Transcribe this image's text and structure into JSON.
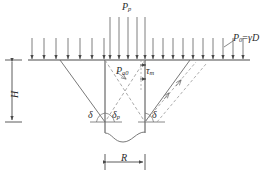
{
  "figure": {
    "domain": "engineering-diagram",
    "stroke_color": "#4a4a4a",
    "dash_color": "#8c8c8c",
    "text_color": "#2b2b2b",
    "background": "#ffffff"
  },
  "labels": {
    "top_load": {
      "base": "P",
      "sub": "p"
    },
    "surface_pressure": {
      "base": "P",
      "sub": "0",
      "equals": "=",
      "expr": "γD"
    },
    "interior_pressure": {
      "base": "P",
      "sub": "a0"
    },
    "shear_stress": {
      "base": "τ",
      "sub": "m"
    },
    "depth": {
      "base": "H"
    },
    "radius": {
      "base": "R"
    },
    "angle_left": {
      "base": "δ"
    },
    "angle_mid": {
      "base": "δ",
      "sub": "p"
    },
    "angle_right": {
      "base": "δ"
    }
  },
  "geometry": {
    "ground_line_y": 60,
    "shaft_left_x": 105,
    "shaft_right_x": 145,
    "shaft_base_y": 122,
    "wedge_left_apex_x": 60,
    "wedge_right_apex_x": 190,
    "dimension_R_y": 162,
    "dimension_H_x": 12
  },
  "arrows": {
    "surcharge_count_left": 11,
    "surcharge_count_center": 5,
    "surcharge_count_right": 11,
    "center_arrow_length": 42,
    "side_arrow_length": 22
  }
}
